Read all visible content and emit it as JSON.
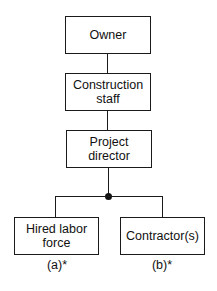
{
  "diagram": {
    "type": "organization-chart",
    "nodes": [
      {
        "id": "owner",
        "label": "Owner"
      },
      {
        "id": "construction_staff",
        "label": "Construction\nstaff"
      },
      {
        "id": "project_director",
        "label": "Project\ndirector"
      },
      {
        "id": "hired_labor",
        "label": "Hired labor\nforce",
        "note": "(a)*"
      },
      {
        "id": "contractors",
        "label": "Contractor(s)",
        "note": "(b)*"
      }
    ],
    "edges": [
      {
        "from": "owner",
        "to": "construction_staff"
      },
      {
        "from": "construction_staff",
        "to": "project_director"
      },
      {
        "from": "project_director",
        "to": "hired_labor"
      },
      {
        "from": "project_director",
        "to": "contractors"
      }
    ]
  }
}
